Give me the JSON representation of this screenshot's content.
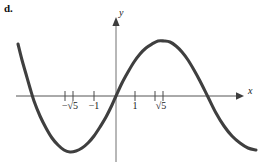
{
  "figure": {
    "part_label": "d.",
    "background_color": "#ffffff",
    "curve_color": "#3f3f3f",
    "axis_color": "#555555"
  },
  "axes": {
    "x_axis_label": "x",
    "y_axis_label": "y",
    "x_axis_pixel_y": 96,
    "y_axis_pixel_x": 116,
    "x_axis_start_px": 16,
    "x_axis_end_px": 240,
    "y_axis_top_px": 18,
    "y_axis_bottom_px": 162
  },
  "ticks": {
    "labeled": [
      {
        "label": "−√5",
        "value": -2.236,
        "pixel_x": 69
      },
      {
        "label": "−1",
        "value": -1,
        "pixel_x": 94
      },
      {
        "label": "1",
        "value": 1,
        "pixel_x": 135
      },
      {
        "label": "√5",
        "value": 2.236,
        "pixel_x": 159
      }
    ],
    "marks_pixel_x": [
      65,
      73,
      94,
      135,
      155,
      163
    ]
  },
  "chart_data": {
    "type": "line",
    "title": "",
    "xlabel": "x",
    "ylabel": "y",
    "grid": false,
    "legend": null,
    "xlim": [
      -5.3,
      7.4
    ],
    "ylim": [
      -5.6,
      5.5
    ],
    "annotations": [
      "d."
    ],
    "tick_labels_x": [
      "−√5",
      "−1",
      "1",
      "√5"
    ],
    "tick_values_x": [
      -2.236,
      -1,
      1,
      2.236
    ],
    "tick_labels_y": [],
    "zeros": [
      -4.5,
      0,
      4.5
    ],
    "local_minimum": {
      "x": -2.6,
      "y": -2.9
    },
    "local_maximum": {
      "x": 2.5,
      "y": 2.9
    },
    "series": [
      {
        "name": "curve",
        "points_pixel": [
          [
            18,
            44
          ],
          [
            22,
            60
          ],
          [
            26,
            74
          ],
          [
            30,
            88
          ],
          [
            34,
            101
          ],
          [
            40,
            116
          ],
          [
            46,
            128
          ],
          [
            52,
            138
          ],
          [
            58,
            145
          ],
          [
            64,
            150
          ],
          [
            70,
            152
          ],
          [
            76,
            151
          ],
          [
            82,
            148
          ],
          [
            88,
            143
          ],
          [
            94,
            136
          ],
          [
            100,
            127
          ],
          [
            106,
            117
          ],
          [
            112,
            105
          ],
          [
            116,
            96
          ],
          [
            122,
            83
          ],
          [
            128,
            72
          ],
          [
            134,
            62
          ],
          [
            140,
            54
          ],
          [
            146,
            48
          ],
          [
            152,
            44
          ],
          [
            158,
            41
          ],
          [
            164,
            41
          ],
          [
            170,
            42
          ],
          [
            176,
            46
          ],
          [
            182,
            52
          ],
          [
            188,
            60
          ],
          [
            194,
            70
          ],
          [
            200,
            81
          ],
          [
            208,
            97
          ],
          [
            216,
            113
          ],
          [
            224,
            126
          ],
          [
            232,
            136
          ],
          [
            240,
            143
          ],
          [
            248,
            148
          ],
          [
            256,
            150
          ]
        ]
      }
    ]
  }
}
